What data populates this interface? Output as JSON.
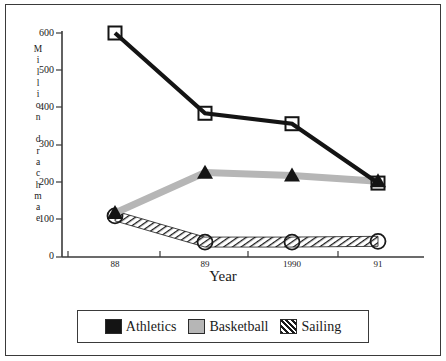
{
  "chart_data": {
    "type": "line",
    "title": "",
    "xlabel": "Year",
    "ylabel": "Million drachmae",
    "ylabel_chars": [
      "M",
      "i",
      "l",
      "l",
      "i",
      "o",
      "n",
      "",
      "d",
      "r",
      "a",
      "c",
      "h",
      "m",
      "a",
      "e"
    ],
    "categories": [
      "88",
      "89",
      "1990",
      "91"
    ],
    "x_tick_labels": [
      "88",
      "89",
      "1990",
      "91"
    ],
    "y_tick_labels": [
      "600",
      "500",
      "400",
      "300",
      "200",
      "100",
      "0"
    ],
    "y_tick_values": [
      600,
      500,
      400,
      300,
      200,
      100,
      0
    ],
    "ylim": [
      0,
      600
    ],
    "grid": false,
    "legend_position": "bottom",
    "series": [
      {
        "name": "Athletics",
        "values": [
          600,
          385,
          357,
          198
        ],
        "color": "#141414",
        "marker": "open-square",
        "line_style": "solid-thick"
      },
      {
        "name": "Basketball",
        "values": [
          118,
          226,
          218,
          203
        ],
        "color": "#b6b6b6",
        "marker": "filled-triangle",
        "line_style": "solid-thick-gray"
      },
      {
        "name": "Sailing",
        "values": [
          110,
          40,
          40,
          42
        ],
        "color": "#1a1a1a",
        "marker": "open-circle",
        "line_style": "hatched"
      }
    ]
  },
  "legend": {
    "entries": [
      {
        "label": "Athletics",
        "swatch": "black-square-swatch"
      },
      {
        "label": "Basketball",
        "swatch": "gray-square-swatch"
      },
      {
        "label": "Sailing",
        "swatch": "hatched-square-swatch"
      }
    ]
  }
}
